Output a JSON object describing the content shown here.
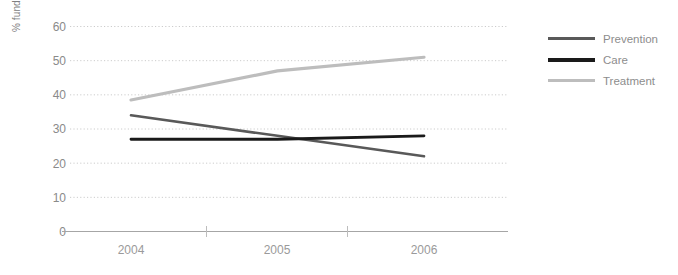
{
  "chart_data": {
    "type": "line",
    "title": "",
    "xlabel": "",
    "ylabel": "% funding",
    "categories": [
      "2004",
      "2005",
      "2006"
    ],
    "x": [
      2004,
      2005,
      2006
    ],
    "ylim": [
      0,
      60
    ],
    "yticks": [
      0,
      10,
      20,
      30,
      40,
      50,
      60
    ],
    "ytick_labels": [
      "0",
      "10",
      "20",
      "30",
      "40",
      "50",
      "60"
    ],
    "grid": true,
    "grid_style": "dotted-horizontal",
    "legend_position": "right",
    "series": [
      {
        "name": "Prevention",
        "values": [
          34,
          28,
          22
        ],
        "color": "#595959"
      },
      {
        "name": "Care",
        "values": [
          27,
          27,
          28
        ],
        "color": "#1a1a1a"
      },
      {
        "name": "Treatment",
        "values": [
          38.5,
          47,
          51
        ],
        "color": "#bdbdbd"
      }
    ]
  },
  "axis": {
    "y_title": "% funding",
    "y_ticks": [
      {
        "label": "60",
        "value": 60
      },
      {
        "label": "50",
        "value": 50
      },
      {
        "label": "40",
        "value": 40
      },
      {
        "label": "30",
        "value": 30
      },
      {
        "label": "20",
        "value": 20
      },
      {
        "label": "10",
        "value": 10
      },
      {
        "label": "0",
        "value": 0
      }
    ],
    "x_ticks": [
      {
        "label": "2004"
      },
      {
        "label": "2005"
      },
      {
        "label": "2006"
      }
    ]
  },
  "legend": {
    "items": [
      {
        "label": "Prevention",
        "color": "#595959"
      },
      {
        "label": "Care",
        "color": "#1a1a1a"
      },
      {
        "label": "Treatment",
        "color": "#bdbdbd"
      }
    ]
  },
  "colors": {
    "background": "#ffffff",
    "gridline": "#cccccc",
    "axis_line": "#9e9e9e",
    "tick_text": "#8a8a8a",
    "legend_text": "#8d8d8d",
    "prevention": "#595959",
    "care": "#1a1a1a",
    "treatment": "#bdbdbd"
  }
}
